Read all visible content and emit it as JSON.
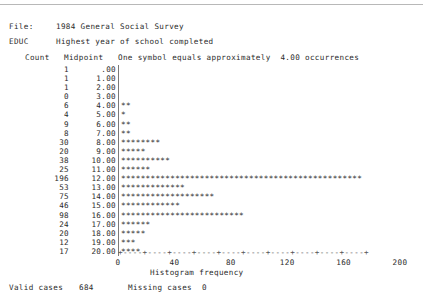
{
  "header": {
    "file_label": "File:",
    "file_value": "1984 General Social Survey",
    "variable_label": "EDUC",
    "variable_value": "Highest year of school completed"
  },
  "columns": {
    "count": "Count",
    "midpoint": "Midpoint",
    "symbol_note": "One symbol equals approximately  4.00 occurrences"
  },
  "footer": {
    "valid_label": "Valid cases",
    "valid_value": "684",
    "missing_label": "Missing cases",
    "missing_value": "0"
  },
  "chart_data": {
    "type": "bar",
    "title": "EDUC  Highest year of school completed",
    "xlabel": "Histogram frequency",
    "ylabel": "Midpoint",
    "xlim": [
      0,
      200
    ],
    "xticks": [
      0,
      20,
      40,
      60,
      80,
      100,
      120,
      140,
      160,
      180,
      200
    ],
    "xtick_labels": [
      "0",
      "",
      "40",
      "",
      "80",
      "",
      "120",
      "",
      "160",
      "",
      "200"
    ],
    "grid": false,
    "legend": null,
    "symbol_scale": 4.0,
    "symbol_char": "*",
    "categories": [
      ".00",
      "1.00",
      "2.00",
      "3.00",
      "4.00",
      "5.00",
      "6.00",
      "7.00",
      "8.00",
      "9.00",
      "10.00",
      "11.00",
      "12.00",
      "13.00",
      "14.00",
      "15.00",
      "16.00",
      "17.00",
      "18.00",
      "19.00",
      "20.00"
    ],
    "values": [
      1,
      1,
      1,
      0,
      6,
      4,
      9,
      8,
      30,
      20,
      38,
      25,
      196,
      53,
      75,
      46,
      98,
      24,
      20,
      12,
      17
    ],
    "rows": [
      {
        "count": "1",
        "midpoint": ".00",
        "symbols": 0
      },
      {
        "count": "1",
        "midpoint": "1.00",
        "symbols": 0
      },
      {
        "count": "1",
        "midpoint": "2.00",
        "symbols": 0
      },
      {
        "count": "0",
        "midpoint": "3.00",
        "symbols": 0
      },
      {
        "count": "6",
        "midpoint": "4.00",
        "symbols": 2
      },
      {
        "count": "4",
        "midpoint": "5.00",
        "symbols": 1
      },
      {
        "count": "9",
        "midpoint": "6.00",
        "symbols": 2
      },
      {
        "count": "8",
        "midpoint": "7.00",
        "symbols": 2
      },
      {
        "count": "30",
        "midpoint": "8.00",
        "symbols": 8
      },
      {
        "count": "20",
        "midpoint": "9.00",
        "symbols": 5
      },
      {
        "count": "38",
        "midpoint": "10.00",
        "symbols": 10
      },
      {
        "count": "25",
        "midpoint": "11.00",
        "symbols": 6
      },
      {
        "count": "196",
        "midpoint": "12.00",
        "symbols": 49
      },
      {
        "count": "53",
        "midpoint": "13.00",
        "symbols": 13
      },
      {
        "count": "75",
        "midpoint": "14.00",
        "symbols": 19
      },
      {
        "count": "46",
        "midpoint": "15.00",
        "symbols": 12
      },
      {
        "count": "98",
        "midpoint": "16.00",
        "symbols": 25
      },
      {
        "count": "24",
        "midpoint": "17.00",
        "symbols": 6
      },
      {
        "count": "20",
        "midpoint": "18.00",
        "symbols": 5
      },
      {
        "count": "12",
        "midpoint": "19.00",
        "symbols": 3
      },
      {
        "count": "17",
        "midpoint": "20.00",
        "symbols": 4
      }
    ]
  }
}
